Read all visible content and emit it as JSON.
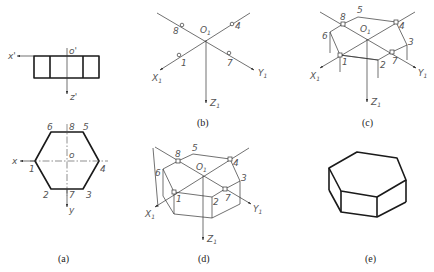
{
  "figure": {
    "panels": [
      {
        "id": "a",
        "caption": "(a)",
        "description": "Orthographic front and top views of hexagonal prism",
        "front_view": {
          "origin_label": "o'",
          "x_axis_label": "x'",
          "z_axis_label": "z'"
        },
        "top_view": {
          "origin_label": "o",
          "x_axis_label": "x",
          "y_axis_label": "y",
          "vertex_labels": [
            "1",
            "2",
            "3",
            "4",
            "5",
            "6",
            "7",
            "8"
          ]
        }
      },
      {
        "id": "b",
        "caption": "(b)",
        "description": "Isometric axes with points located",
        "origin_label": "O",
        "origin_sub": "1",
        "axis_labels": {
          "x": "X",
          "y": "Y",
          "z": "Z",
          "sub": "1"
        },
        "point_labels": [
          "8",
          "4",
          "1",
          "7"
        ]
      },
      {
        "id": "c",
        "caption": "(c)",
        "description": "Top hexagon drawn with vertical edges",
        "origin_label": "O",
        "origin_sub": "1",
        "axis_labels": {
          "x": "X",
          "y": "Y",
          "z": "Z",
          "sub": "1"
        },
        "point_labels": [
          "5",
          "8",
          "4",
          "6",
          "3",
          "1",
          "7",
          "2"
        ]
      },
      {
        "id": "d",
        "caption": "(d)",
        "description": "Bottom edges connected",
        "origin_label": "O",
        "origin_sub": "1",
        "axis_labels": {
          "x": "X",
          "y": "Y",
          "z": "Z",
          "sub": "1"
        },
        "point_labels": [
          "5",
          "8",
          "4",
          "6",
          "3",
          "1",
          "7",
          "2"
        ]
      },
      {
        "id": "e",
        "caption": "(e)",
        "description": "Finished isometric hexagonal prism"
      }
    ]
  }
}
